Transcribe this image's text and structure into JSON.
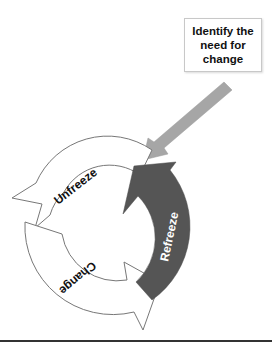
{
  "title_box": {
    "text": "Identify the need for change"
  },
  "cycle": {
    "stages": [
      {
        "label": "Unfreeze",
        "fill": "#ffffff",
        "stroke": "#777777",
        "text_color": "#111111"
      },
      {
        "label": "Change",
        "fill": "#ffffff",
        "stroke": "#777777",
        "text_color": "#111111"
      },
      {
        "label": "Refreeze",
        "fill": "#555555",
        "stroke": "#555555",
        "text_color": "#ffffff"
      }
    ]
  },
  "input_arrow": {
    "fill": "#a6a6a6",
    "direction": "down-left"
  },
  "colors": {
    "background": "#ffffff",
    "rule": "#333333"
  }
}
